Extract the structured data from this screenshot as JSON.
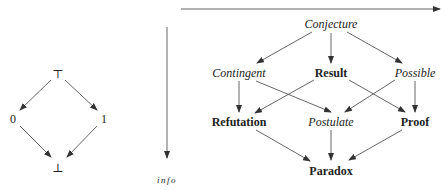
{
  "left_lattice": {
    "nodes": [
      {
        "id": "top",
        "label": "⊤",
        "x": 58,
        "y": 72
      },
      {
        "id": "zero",
        "label": "0",
        "x": 13,
        "y": 118
      },
      {
        "id": "one",
        "label": "1",
        "x": 104,
        "y": 118
      },
      {
        "id": "bottom",
        "label": "⊥",
        "x": 58,
        "y": 167
      }
    ]
  },
  "axes": {
    "horizontal_arrow": "truth ordering",
    "vertical_label": "info"
  },
  "right_lattice": {
    "nodes": [
      {
        "id": "conjecture",
        "label": "Conjecture",
        "style": "italic"
      },
      {
        "id": "contingent",
        "label": "Contingent",
        "style": "italic"
      },
      {
        "id": "result",
        "label": "Result",
        "style": "bold"
      },
      {
        "id": "possible",
        "label": "Possible",
        "style": "italic"
      },
      {
        "id": "refutation",
        "label": "Refutation",
        "style": "bold"
      },
      {
        "id": "postulate",
        "label": "Postulate",
        "style": "italic"
      },
      {
        "id": "proof",
        "label": "Proof",
        "style": "bold"
      },
      {
        "id": "paradox",
        "label": "Paradox",
        "style": "bold"
      }
    ]
  }
}
